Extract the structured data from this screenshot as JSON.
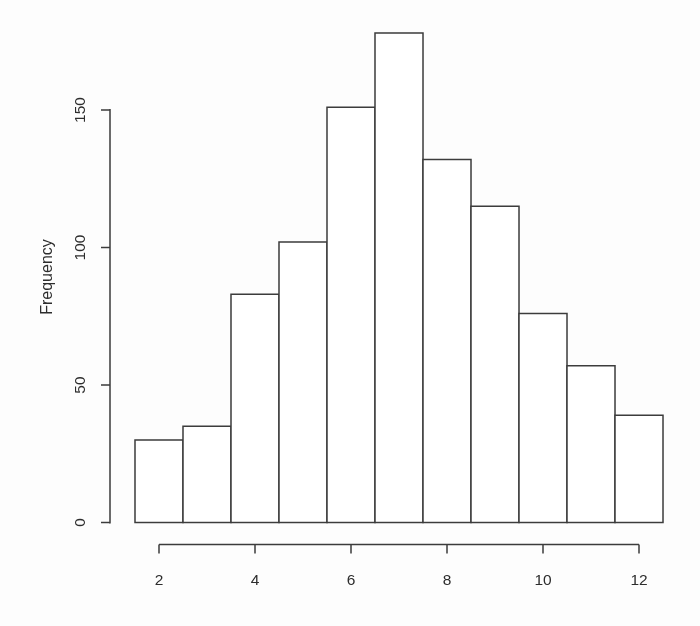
{
  "figure": {
    "background": "#fdfdfd",
    "line_color": "#3d3d3d",
    "text_color": "#2f2f2f"
  },
  "chart_data": {
    "type": "bar",
    "subtype": "histogram",
    "title": "",
    "xlabel": "",
    "ylabel": "Frequency",
    "bin_edges": [
      1.5,
      2.5,
      3.5,
      4.5,
      5.5,
      6.5,
      7.5,
      8.5,
      9.5,
      10.5,
      11.5,
      12.5
    ],
    "bin_centers": [
      2,
      3,
      4,
      5,
      6,
      7,
      8,
      9,
      10,
      11,
      12
    ],
    "values": [
      30,
      35,
      83,
      102,
      151,
      178,
      132,
      115,
      76,
      57,
      39
    ],
    "x_ticks": [
      2,
      4,
      6,
      8,
      10,
      12
    ],
    "y_ticks": [
      0,
      50,
      100,
      150
    ],
    "xlim": [
      1.5,
      12.5
    ],
    "ylim": [
      0,
      178
    ],
    "grid": false,
    "legend": "none",
    "bar_fill": "#ffffff",
    "bar_stroke": "#3d3d3d"
  }
}
